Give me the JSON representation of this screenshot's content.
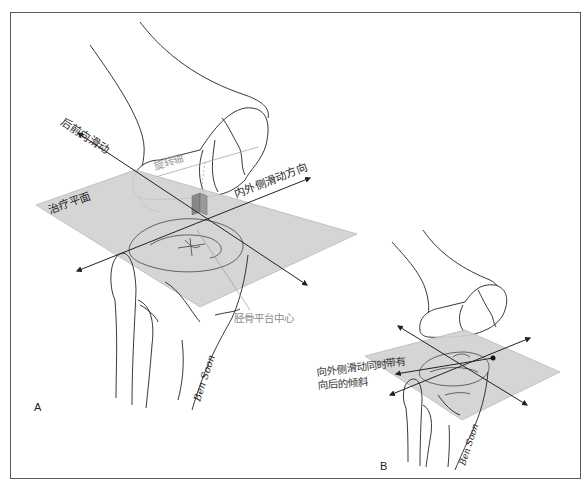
{
  "figure": {
    "frame_color": "#5a5a5a",
    "plane_fill": "#d2d2d2",
    "plane_stroke": "#b4b4b4",
    "line_color": "#222222",
    "label_gray": "#8a8a8a"
  },
  "panel_a": {
    "letter": "A",
    "labels": {
      "ap_glide": "后前向滑动",
      "rotation_axis": "旋转轴",
      "treatment_plane": "治疗平面",
      "ml_glide_direction": "内外侧滑动方向",
      "tibial_plateau_center": "胫骨平台中心",
      "artist_signature": "Ben Soon"
    }
  },
  "panel_b": {
    "letter": "B",
    "labels": {
      "lateral_glide_with_tilt_line1": "向外侧滑动同时带有",
      "lateral_glide_with_tilt_line2": "向后的倾斜",
      "artist_signature": "Ben Soon"
    }
  }
}
